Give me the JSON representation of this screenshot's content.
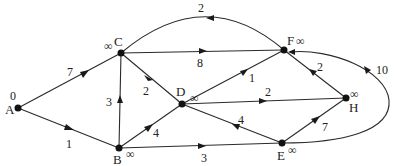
{
  "diagram": {
    "type": "weighted-directed-graph",
    "colors": {
      "stroke": "#2a2a2a",
      "node": "#111111",
      "text": "#222222",
      "background": "#ffffff"
    },
    "nodes": [
      {
        "id": "A",
        "label": "A",
        "distance": "0"
      },
      {
        "id": "B",
        "label": "B",
        "distance": "∞"
      },
      {
        "id": "C",
        "label": "C",
        "distance": "∞"
      },
      {
        "id": "D",
        "label": "D",
        "distance": "∞"
      },
      {
        "id": "E",
        "label": "E",
        "distance": "∞"
      },
      {
        "id": "F",
        "label": "F",
        "distance": "∞"
      },
      {
        "id": "H",
        "label": "H",
        "distance": "∞"
      }
    ],
    "edges": [
      {
        "from": "A",
        "to": "C",
        "weight": "7"
      },
      {
        "from": "A",
        "to": "B",
        "weight": "1"
      },
      {
        "from": "B",
        "to": "C",
        "weight": "3"
      },
      {
        "from": "C",
        "to": "D",
        "weight": "2"
      },
      {
        "from": "B",
        "to": "D",
        "weight": "4"
      },
      {
        "from": "C",
        "to": "F",
        "weight": "8"
      },
      {
        "from": "F",
        "to": "C",
        "weight": "2"
      },
      {
        "from": "B",
        "to": "E",
        "weight": "3"
      },
      {
        "from": "D",
        "to": "F",
        "weight": "1"
      },
      {
        "from": "D",
        "to": "H",
        "weight": "2"
      },
      {
        "from": "E",
        "to": "D",
        "weight": "4"
      },
      {
        "from": "E",
        "to": "H",
        "weight": "7"
      },
      {
        "from": "H",
        "to": "F",
        "weight": "2"
      },
      {
        "from": "E",
        "to": "F",
        "weight": "10"
      }
    ]
  }
}
